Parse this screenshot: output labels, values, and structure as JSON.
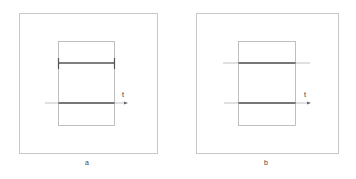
{
  "panels": [
    {
      "id": "a",
      "caption": "a",
      "axis_label": "t",
      "top_segment_style": "bounded-with-end-caps",
      "description": "Top segment spans exactly the inner rectangle width with vertical end caps; lower segment lies on the t-axis within the rectangle."
    },
    {
      "id": "b",
      "caption": "b",
      "axis_label": "t",
      "top_segment_style": "line-extends-beyond-rectangle",
      "description": "Top thin line extends past both rectangle edges with a thicker segment inside; lower segment lies on the t-axis within the rectangle."
    }
  ],
  "colors": {
    "frame": "#c8c8c8",
    "inner_rect": "#b0b0b0",
    "thin_line": "#a8a8a8",
    "thick_segment": "#555555",
    "axis": "#a0a0a0"
  }
}
